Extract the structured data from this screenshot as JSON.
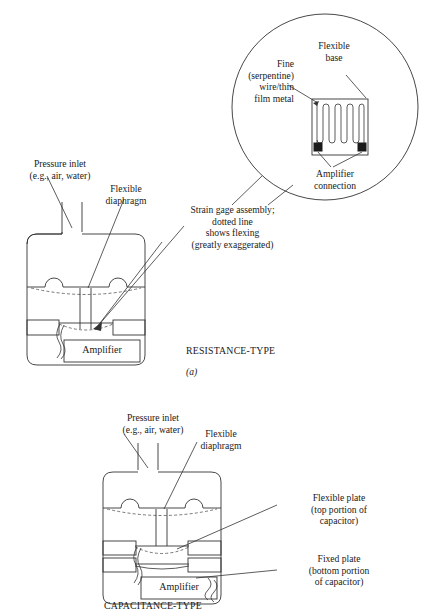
{
  "figure": {
    "title_a": "RESISTANCE-TYPE",
    "subcaption_a": "(a)",
    "title_b": "CAPACITANCE-TYPE"
  },
  "detail_circle": {
    "label_fine_wire": "Fine\n(serpentine)\nwire/thin\nfilm metal",
    "label_flexible_base": "Flexible\nbase",
    "label_amplifier_connection": "Amplifier\nconnection",
    "serpentine_strips": 10
  },
  "callouts": {
    "strain_gage_assembly": "Strain gage assembly;\ndotted line\nshows flexing\n(greatly exaggerated)"
  },
  "diagram_a": {
    "label_pressure_inlet": "Pressure inlet\n(e.g., air, water)",
    "label_flexible_diaphragm": "Flexible\ndiaphragm",
    "amplifier_label": "Amplifier"
  },
  "diagram_b": {
    "label_pressure_inlet": "Pressure inlet\n(e.g., air, water)",
    "label_flexible_diaphragm": "Flexible\ndiaphragm",
    "label_flexible_plate": "Flexible plate\n(top portion of\ncapacitor)",
    "label_fixed_plate": "Fixed plate\n(bottom portion\nof capacitor)",
    "amplifier_label": "Amplifier"
  },
  "colors": {
    "ink": "#1a1a1a",
    "line": "#333333",
    "dashed": "#555555",
    "page": "#ffffff"
  }
}
